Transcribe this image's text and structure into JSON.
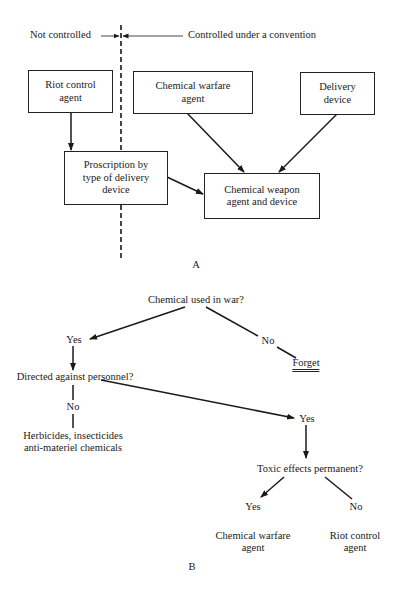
{
  "diagram_a": {
    "label": "A",
    "boundary": {
      "left_label": "Not controlled",
      "right_label": "Controlled under a convention"
    },
    "boxes": {
      "riot_control": {
        "line1": "Riot control",
        "line2": "agent"
      },
      "chemical_warfare": {
        "line1": "Chemical warfare",
        "line2": "agent"
      },
      "delivery_device": {
        "line1": "Delivery",
        "line2": "device"
      },
      "proscription": {
        "line1": "Proscription by",
        "line2": "type of delivery",
        "line3": "device"
      },
      "chemical_weapon": {
        "line1": "Chemical weapon",
        "line2": "agent and device"
      }
    },
    "edges": [
      {
        "from": "riot_control",
        "to": "proscription"
      },
      {
        "from": "chemical_warfare",
        "to": "chemical_weapon"
      },
      {
        "from": "delivery_device",
        "to": "chemical_weapon"
      },
      {
        "from": "proscription",
        "to": "chemical_weapon"
      }
    ]
  },
  "diagram_b": {
    "label": "B",
    "root_question": "Chemical used in war?",
    "root_yes": "Yes",
    "root_no": "No",
    "forget": "Forget",
    "personnel_question": "Directed against personnel?",
    "personnel_no": "No",
    "personnel_no_result_line1": "Herbicides, insecticides",
    "personnel_no_result_line2": "anti-materiel chemicals",
    "personnel_yes": "Yes",
    "toxic_question": "Toxic effects permanent?",
    "toxic_yes": "Yes",
    "toxic_no": "No",
    "toxic_yes_result_line1": "Chemical warfare",
    "toxic_yes_result_line2": "agent",
    "toxic_no_result_line1": "Riot control",
    "toxic_no_result_line2": "agent"
  }
}
